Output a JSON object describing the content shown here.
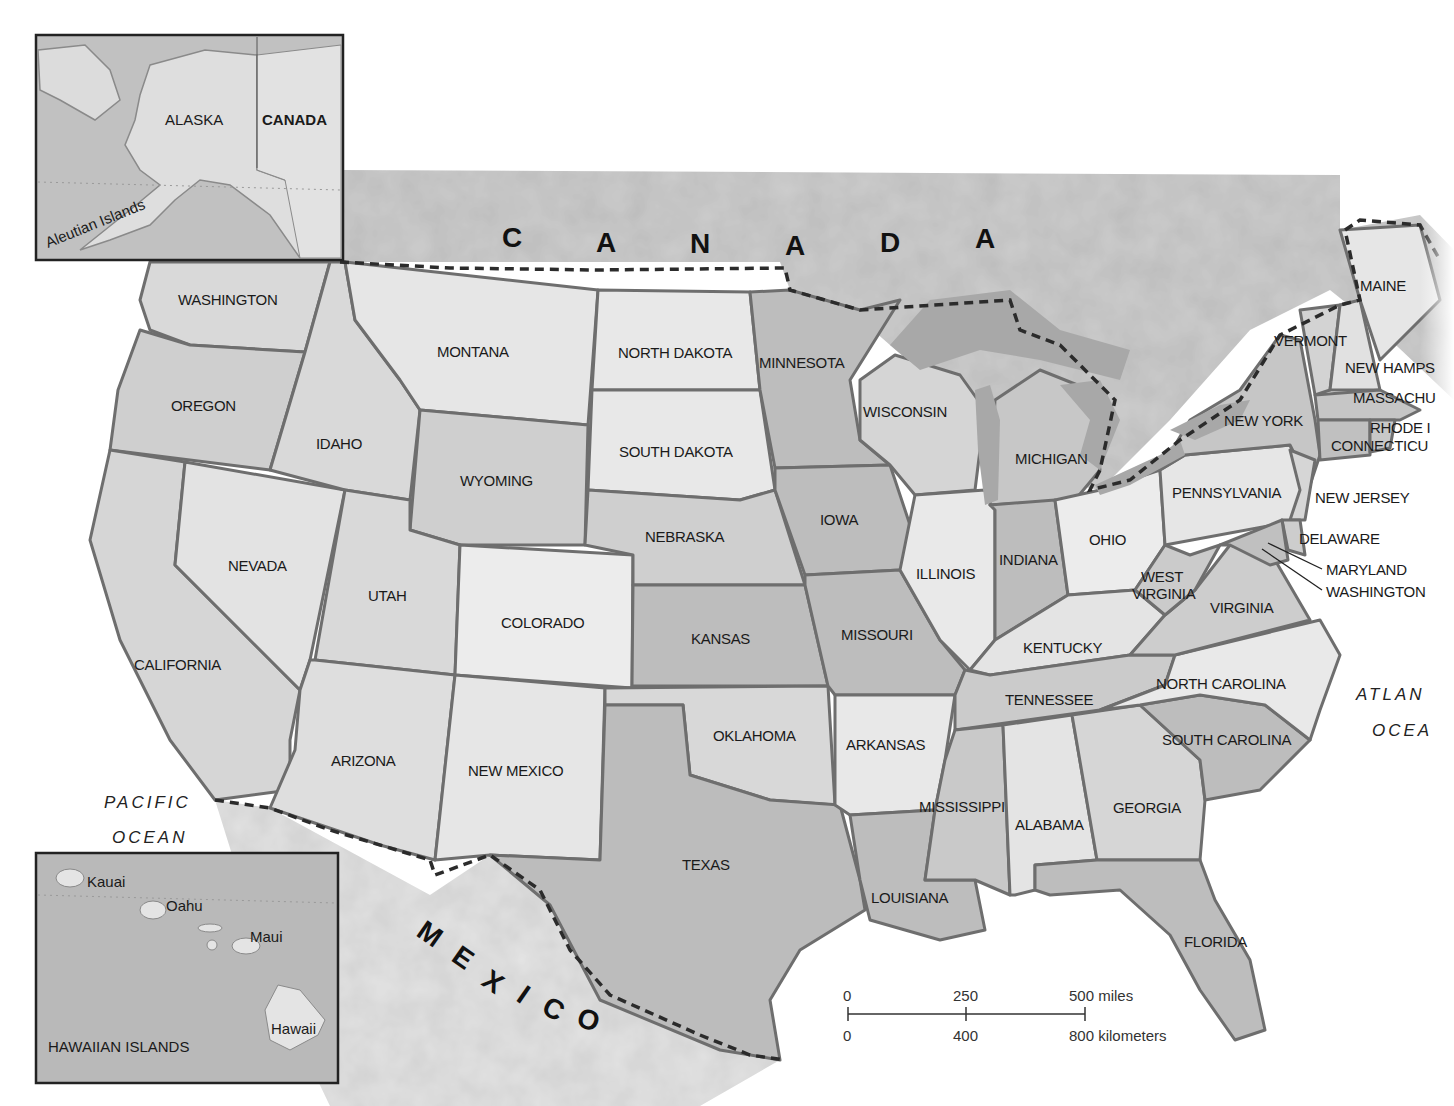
{
  "map": {
    "title": "United States",
    "colors": {
      "background": "#ffffff",
      "canada_land": "#c9c9c9",
      "mexico_land": "#e6e6e6",
      "light_state": "#e9e9e9",
      "medium_state": "#d2d2d2",
      "dark_state": "#b5b5b5",
      "lake": "#a8a8a8",
      "state_border": "#6e6e6e",
      "international_border": "#2b2b2b",
      "inset_bg": "#b9b9b9",
      "inset_border": "#222222"
    },
    "countries": {
      "canada_letters": [
        "C",
        "A",
        "N",
        "A",
        "D",
        "A"
      ],
      "mexico_letters": [
        "M",
        "E",
        "X",
        "I",
        "C",
        "O"
      ]
    },
    "oceans": {
      "pacific_line1": "PACIFIC",
      "pacific_line2": "OCEAN",
      "atlantic_line1": "ATLAN",
      "atlantic_line2": "OCEA"
    },
    "states": {
      "washington": "WASHINGTON",
      "oregon": "OREGON",
      "california": "CALIFORNIA",
      "nevada": "NEVADA",
      "idaho": "IDAHO",
      "montana": "MONTANA",
      "wyoming": "WYOMING",
      "utah": "UTAH",
      "arizona": "ARIZONA",
      "colorado": "COLORADO",
      "new_mexico": "NEW MEXICO",
      "north_dakota": "NORTH DAKOTA",
      "south_dakota": "SOUTH DAKOTA",
      "nebraska": "NEBRASKA",
      "kansas": "KANSAS",
      "oklahoma": "OKLAHOMA",
      "texas": "TEXAS",
      "minnesota": "MINNESOTA",
      "iowa": "IOWA",
      "missouri": "MISSOURI",
      "arkansas": "ARKANSAS",
      "louisiana": "LOUISIANA",
      "wisconsin": "WISCONSIN",
      "illinois": "ILLINOIS",
      "michigan": "MICHIGAN",
      "indiana": "INDIANA",
      "ohio": "OHIO",
      "kentucky": "KENTUCKY",
      "tennessee": "TENNESSEE",
      "mississippi": "MISSISSIPPI",
      "alabama": "ALABAMA",
      "georgia": "GEORGIA",
      "florida": "FLORIDA",
      "south_carolina": "SOUTH CAROLINA",
      "north_carolina": "NORTH CAROLINA",
      "virginia": "VIRGINIA",
      "west_virginia_line1": "WEST",
      "west_virginia_line2": "VIRGINIA",
      "pennsylvania": "PENNSYLVANIA",
      "new_york": "NEW YORK",
      "vermont": "VERMONT",
      "new_hampshire": "NEW HAMPS",
      "maine": "MAINE",
      "massachusetts": "MASSACHU",
      "rhode_island": "RHODE I",
      "connecticut": "CONNECTICU",
      "new_jersey": "NEW JERSEY",
      "delaware": "DELAWARE",
      "maryland": "MARYLAND",
      "washington_dc": "WASHINGTON"
    },
    "alaska_inset": {
      "alaska": "ALASKA",
      "canada": "CANADA",
      "aleutian": "Aleutian Islands"
    },
    "hawaii_inset": {
      "title": "HAWAIIAN ISLANDS",
      "kauai": "Kauai",
      "oahu": "Oahu",
      "maui": "Maui",
      "hawaii": "Hawaii"
    },
    "scale_bar": {
      "miles": [
        "0",
        "250",
        "500 miles"
      ],
      "kilometers": [
        "0",
        "400",
        "800 kilometers"
      ]
    }
  }
}
